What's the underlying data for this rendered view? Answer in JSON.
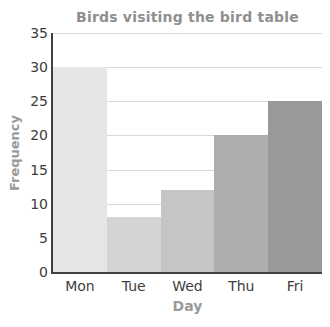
{
  "chart_data": {
    "type": "bar",
    "title": "Birds visiting the bird table",
    "xlabel": "Day",
    "ylabel": "Frequency",
    "categories": [
      "Mon",
      "Tue",
      "Wed",
      "Thu",
      "Fri"
    ],
    "values": [
      30,
      8,
      12,
      20,
      25
    ],
    "ylim": [
      0,
      35
    ],
    "ytick_step": 5,
    "yticks": [
      0,
      5,
      10,
      15,
      20,
      25,
      30,
      35
    ],
    "grid": true,
    "legend": false,
    "bar_colors": [
      "#e6e6e6",
      "#d4d4d4",
      "#c5c5c5",
      "#adadad",
      "#999999"
    ],
    "colors": {
      "background": "#ffffff",
      "title": "#8f8f8f",
      "axis_label": "#9a9a9a",
      "tick_label": "#3d3d3d",
      "axis_line": "#404040",
      "gridline": "#d9d9d9"
    }
  }
}
